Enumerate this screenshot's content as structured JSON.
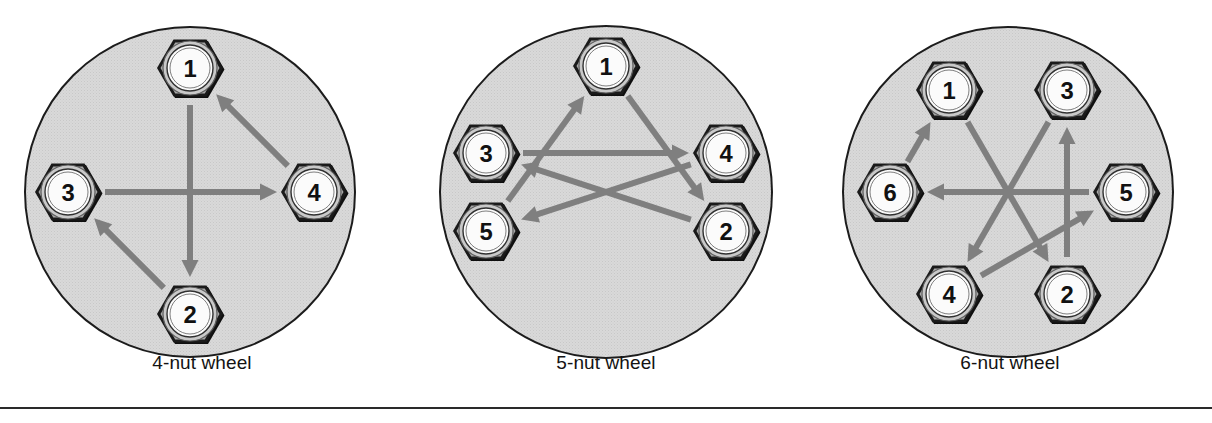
{
  "figure": {
    "colors": {
      "wheel_fill": "#d9d9d9",
      "wheel_stroke": "#1c1c1c",
      "nut_outer": "#1a1a1a",
      "nut_body": "#a8a8a8",
      "nut_ring": "#c9c9c9",
      "nut_face": "#fbfbfb",
      "arrow": "#7f7f7f",
      "text": "#131313",
      "rule": "#2a2a2a",
      "page_background": "#ffffff"
    },
    "rule": {
      "present": true,
      "y": 407
    },
    "panels": [
      {
        "id": "panel-4-nut",
        "caption": "4-nut wheel",
        "nut_count": 4,
        "wheel": {
          "cx": 190,
          "cy": 192,
          "r": 165
        },
        "nut_radius_from_center": 124,
        "nut_size": 33,
        "nuts": [
          {
            "label": "1",
            "angle_deg": -90,
            "cx": 190,
            "cy": 68
          },
          {
            "label": "2",
            "angle_deg": 90,
            "cx": 190,
            "cy": 314
          },
          {
            "label": "3",
            "angle_deg": 180,
            "cx": 68,
            "cy": 192
          },
          {
            "label": "4",
            "angle_deg": 0,
            "cx": 314,
            "cy": 192
          }
        ],
        "sequence": [
          "1",
          "2",
          "3",
          "4"
        ],
        "arrows": [
          {
            "from": "1",
            "to": "2"
          },
          {
            "from": "2",
            "to": "3"
          },
          {
            "from": "3",
            "to": "4"
          },
          {
            "from": "4",
            "to": "1"
          }
        ]
      },
      {
        "id": "panel-5-nut",
        "caption": "5-nut wheel",
        "nut_count": 5,
        "wheel": {
          "cx": 202,
          "cy": 192,
          "r": 166
        },
        "nut_radius_from_center": 126,
        "nut_size": 33,
        "nuts": [
          {
            "label": "1",
            "angle_deg": -90,
            "cx": 202,
            "cy": 66
          },
          {
            "label": "2",
            "angle_deg": -18,
            "cx": 322,
            "cy": 231
          },
          {
            "label": "3",
            "angle_deg": 198,
            "cx": 82,
            "cy": 153
          },
          {
            "label": "4",
            "angle_deg": -18,
            "cx": 322,
            "cy": 153
          },
          {
            "label": "5",
            "angle_deg": 162,
            "cx": 82,
            "cy": 231
          }
        ],
        "nut_positions_note": "regular pentagon, apex at top",
        "sequence": [
          "1",
          "2",
          "3",
          "4",
          "5"
        ],
        "arrows": [
          {
            "from": "1",
            "to": "2"
          },
          {
            "from": "2",
            "to": "3"
          },
          {
            "from": "3",
            "to": "4"
          },
          {
            "from": "4",
            "to": "5"
          },
          {
            "from": "5",
            "to": "1"
          }
        ]
      },
      {
        "id": "panel-6-nut",
        "caption": "6-nut wheel",
        "nut_count": 6,
        "wheel": {
          "cx": 200,
          "cy": 192,
          "r": 165
        },
        "nut_radius_from_center": 118,
        "nut_size": 33,
        "nuts": [
          {
            "label": "1",
            "angle_deg": -120,
            "cx": 141,
            "cy": 90
          },
          {
            "label": "2",
            "angle_deg": 60,
            "cx": 259,
            "cy": 294
          },
          {
            "label": "3",
            "angle_deg": -60,
            "cx": 259,
            "cy": 90
          },
          {
            "label": "4",
            "angle_deg": 120,
            "cx": 141,
            "cy": 294
          },
          {
            "label": "5",
            "angle_deg": 0,
            "cx": 318,
            "cy": 192
          },
          {
            "label": "6",
            "angle_deg": 180,
            "cx": 82,
            "cy": 192
          }
        ],
        "sequence": [
          "1",
          "2",
          "3",
          "4",
          "5",
          "6"
        ],
        "arrows": [
          {
            "from": "1",
            "to": "2"
          },
          {
            "from": "2",
            "to": "3"
          },
          {
            "from": "3",
            "to": "4"
          },
          {
            "from": "4",
            "to": "5"
          },
          {
            "from": "5",
            "to": "6"
          },
          {
            "from": "6",
            "to": "1",
            "stub": true
          }
        ]
      }
    ]
  }
}
